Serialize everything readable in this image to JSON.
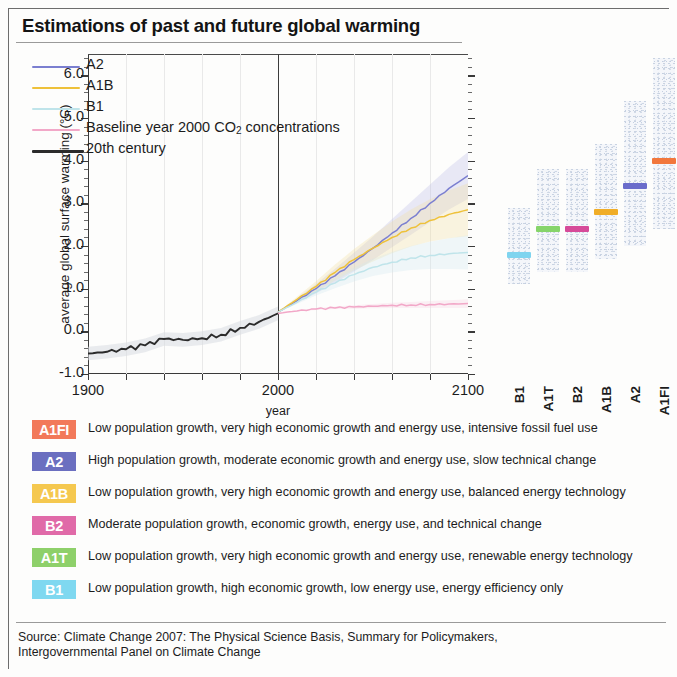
{
  "title": "Estimations of past and future global warming",
  "source": {
    "line1": "Source: Climate Change 2007: The Physical Science Basis, Summary for Policymakers,",
    "line2": "Intergovernmental Panel on Climate Change"
  },
  "chart_data": {
    "type": "line",
    "title": "Estimations of past and future global warming",
    "xlabel": "year",
    "ylabel": "average global surface warming (°C)",
    "xlim": [
      1900,
      2100
    ],
    "ylim": [
      -1.0,
      6.5
    ],
    "xticks": [
      "1900",
      "2000",
      "2100"
    ],
    "yticks": [
      "6.0",
      "5.0",
      "4.0",
      "3.0",
      "2.0",
      "1.0",
      "0.0",
      "-1.0"
    ],
    "grid": "vertical-faint",
    "legend_position": "top-left",
    "divider_year": 2000,
    "series": [
      {
        "name": "A2",
        "color": "#7b7fd0",
        "x": [
          2000,
          2010,
          2020,
          2030,
          2040,
          2050,
          2060,
          2070,
          2080,
          2090,
          2100
        ],
        "values": [
          0.45,
          0.72,
          1.0,
          1.3,
          1.62,
          1.95,
          2.3,
          2.65,
          3.0,
          3.35,
          3.65
        ]
      },
      {
        "name": "A1B",
        "color": "#eec13a",
        "x": [
          2000,
          2010,
          2020,
          2030,
          2040,
          2050,
          2060,
          2070,
          2080,
          2090,
          2100
        ],
        "values": [
          0.45,
          0.75,
          1.05,
          1.38,
          1.68,
          1.95,
          2.2,
          2.42,
          2.6,
          2.74,
          2.85
        ]
      },
      {
        "name": "B1",
        "color": "#bfe4ea",
        "x": [
          2000,
          2010,
          2020,
          2030,
          2040,
          2050,
          2060,
          2070,
          2080,
          2090,
          2100
        ],
        "values": [
          0.45,
          0.68,
          0.92,
          1.13,
          1.33,
          1.5,
          1.62,
          1.72,
          1.78,
          1.82,
          1.85
        ]
      },
      {
        "name": "Baseline year 2000 CO2 concentrations",
        "color": "#f2a8c8",
        "x": [
          2000,
          2010,
          2020,
          2030,
          2040,
          2050,
          2060,
          2070,
          2080,
          2090,
          2100
        ],
        "values": [
          0.42,
          0.48,
          0.52,
          0.55,
          0.57,
          0.59,
          0.61,
          0.62,
          0.63,
          0.64,
          0.65
        ]
      },
      {
        "name": "20th century",
        "color": "#2b2b2b",
        "x": [
          1900,
          1910,
          1920,
          1930,
          1940,
          1950,
          1960,
          1970,
          1980,
          1990,
          2000
        ],
        "values": [
          -0.52,
          -0.48,
          -0.42,
          -0.33,
          -0.18,
          -0.2,
          -0.16,
          -0.08,
          0.08,
          0.22,
          0.42
        ]
      }
    ],
    "scenario_bars": {
      "ylabel_shared": true,
      "categories": [
        "B1",
        "A1T",
        "B2",
        "A1B",
        "A2",
        "A1FI"
      ],
      "best_estimate": [
        1.8,
        2.4,
        2.4,
        2.8,
        3.4,
        4.0
      ],
      "range_low": [
        1.1,
        1.4,
        1.4,
        1.7,
        2.0,
        2.4
      ],
      "range_high": [
        2.9,
        3.8,
        3.8,
        4.4,
        5.4,
        6.4
      ],
      "colors": [
        "#7fd4ef",
        "#86d46a",
        "#d64a99",
        "#f0ad27",
        "#6a6ccb",
        "#f2773c"
      ]
    }
  },
  "legend": {
    "items": [
      {
        "label": "A2",
        "color": "#7b7fd0",
        "has_sub": false
      },
      {
        "label": "A1B",
        "color": "#eec13a",
        "has_sub": false
      },
      {
        "label": "B1",
        "color": "#bfe4ea",
        "has_sub": false
      },
      {
        "label": "Baseline year 2000 CO",
        "sub": "2",
        "label_tail": " concentrations",
        "color": "#f2a8c8",
        "has_sub": true
      },
      {
        "label": "20th century",
        "color": "#2b2b2b",
        "has_sub": false
      }
    ]
  },
  "scenarios": [
    {
      "code": "A1FI",
      "color": "#f2795a",
      "desc": "Low population growth, very high economic growth and energy use, intensive fossil fuel use"
    },
    {
      "code": "A2",
      "color": "#6b6fc0",
      "desc": "High population growth, moderate economic growth and energy use, slow technical change"
    },
    {
      "code": "A1B",
      "color": "#f5c košice",
      "desc": ""
    },
    {
      "code": "B2",
      "color": "#e06aa8",
      "desc": "Moderate population growth, economic growth, energy use, and technical change"
    },
    {
      "code": "A1T",
      "color": "#8ed06a",
      "desc": "Low population growth, very high economic growth and energy use, renewable energy technology"
    },
    {
      "code": "B1",
      "color": "#7fd8f0",
      "desc": "Low population growth, high economic growth, low energy use, energy efficiency only"
    }
  ],
  "scenarios_fixed": [
    {
      "code": "A1FI",
      "color": "#f2795a",
      "desc": "Low population growth, very high economic growth and energy use, intensive fossil fuel use"
    },
    {
      "code": "A2",
      "color": "#6b6fc0",
      "desc": "High population growth, moderate economic growth and energy use, slow technical change"
    },
    {
      "code": "A1B",
      "color": "#f5c84f",
      "desc": "Low population growth, very high economic growth and energy use, balanced energy technology"
    },
    {
      "code": "B2",
      "color": "#e06aa8",
      "desc": "Moderate population growth, economic growth, energy use, and technical change"
    },
    {
      "code": "A1T",
      "color": "#8ed06a",
      "desc": "Low population growth, very high economic growth and energy use, renewable energy technology"
    },
    {
      "code": "B1",
      "color": "#7fd8f0",
      "desc": "Low population growth, high economic growth, low energy use, energy efficiency only"
    }
  ]
}
